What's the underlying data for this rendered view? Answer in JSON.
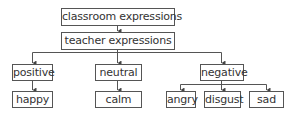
{
  "diagram": {
    "type": "hierarchy-tree",
    "nodes": {
      "root": "classroom expressions",
      "teacher": "teacher expressions",
      "positive": "positive",
      "neutral": "neutral",
      "negative": "negative",
      "happy": "happy",
      "calm": "calm",
      "angry": "angry",
      "disgust": "disgust",
      "sad": "sad"
    },
    "edges": [
      [
        "classroom expressions",
        "teacher expressions"
      ],
      [
        "teacher expressions",
        "positive"
      ],
      [
        "teacher expressions",
        "neutral"
      ],
      [
        "teacher expressions",
        "negative"
      ],
      [
        "positive",
        "happy"
      ],
      [
        "neutral",
        "calm"
      ],
      [
        "negative",
        "angry"
      ],
      [
        "negative",
        "disgust"
      ],
      [
        "negative",
        "sad"
      ]
    ],
    "colors": {
      "line": "#555555",
      "text": "#333333",
      "box_fill": "#ffffff"
    }
  }
}
